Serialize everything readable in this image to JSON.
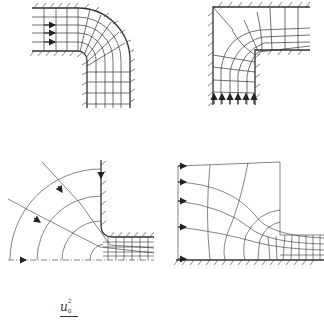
{
  "figure": {
    "panels": [
      {
        "id": "a",
        "name": "90-degree bend, flow entering from left",
        "position": "top-left",
        "inflow_arrows": 3,
        "inflow_direction": "right"
      },
      {
        "id": "b",
        "name": "sharp corner bend, flow entering from bottom",
        "position": "top-right",
        "inflow_arrows": 6,
        "inflow_direction": "up"
      },
      {
        "id": "c",
        "name": "quadrant source flow into channel",
        "position": "bottom-left",
        "streamline_arrows": 3
      },
      {
        "id": "d",
        "name": "contraction from reservoir into channel",
        "position": "bottom-right",
        "inflow_arrows": 5,
        "inflow_direction": "right"
      }
    ],
    "formula": {
      "base": "u",
      "subscript": "0",
      "superscript": "2",
      "text": "u₀²"
    },
    "colors": {
      "line": "#333333",
      "background": "#ffffff"
    }
  }
}
